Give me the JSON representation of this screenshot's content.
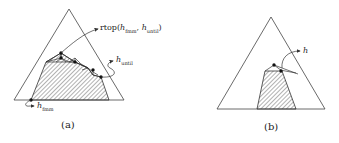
{
  "figure": {
    "panels": [
      {
        "id": "a",
        "caption": "(a)",
        "labels": {
          "rtop_prefix": "rtop(",
          "rtop_arg1": "h",
          "rtop_arg1_sub": "fmm",
          "rtop_sep": ", ",
          "rtop_arg2": "h",
          "rtop_arg2_sub": "until",
          "rtop_suffix": ")",
          "h_until": "h",
          "h_until_sub": "until",
          "h_fmm": "h",
          "h_fmm_sub": "fmm"
        }
      },
      {
        "id": "b",
        "caption": "(b)",
        "labels": {
          "h": "h"
        }
      }
    ],
    "colors": {
      "stroke": "#333333",
      "hatch": "#555555",
      "background": "#ffffff"
    }
  }
}
